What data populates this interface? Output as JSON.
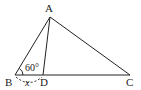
{
  "diagram": {
    "type": "geometry-triangle",
    "points": {
      "A": {
        "label": "A",
        "x": 50,
        "y": 17
      },
      "B": {
        "label": "B",
        "x": 15,
        "y": 75
      },
      "C": {
        "label": "C",
        "x": 130,
        "y": 75
      },
      "D": {
        "label": "D",
        "x": 43,
        "y": 75
      }
    },
    "segments": [
      "AB",
      "AD",
      "AC",
      "BC"
    ],
    "angle_label": "60°",
    "length_label": "x",
    "colors": {
      "stroke": "#222222",
      "background": "#ffffff"
    }
  }
}
